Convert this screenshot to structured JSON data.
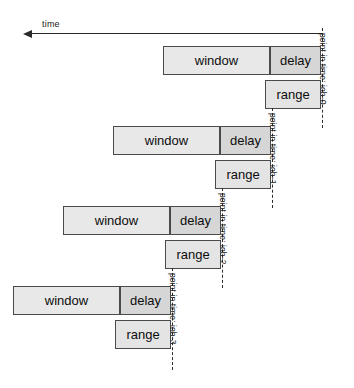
{
  "diagram": {
    "axis": {
      "label": "time",
      "direction": "leftward",
      "x_start": 322,
      "x_end": 32,
      "y": 33
    },
    "labels": {
      "window": "window",
      "delay": "delay",
      "range": "range"
    },
    "colors": {
      "window_fill": "#e8e8e8",
      "delay_fill": "#d6d6d6",
      "range_fill": "#e4e4e4",
      "stroke": "#4a4a4a",
      "axis": "#2a2a2a",
      "marker": "#2b2b2b",
      "background": "#ffffff"
    },
    "jobs": [
      {
        "id": "job-0",
        "pit_label": "point in time: job-0",
        "pit_x": 322,
        "pit_y": 28,
        "pit_height": 100,
        "label_x": 328,
        "label_y": 33,
        "window": {
          "x": 163,
          "y": 46,
          "w": 107,
          "h": 29
        },
        "delay": {
          "x": 270,
          "y": 46,
          "w": 51,
          "h": 29
        },
        "range": {
          "x": 265,
          "y": 80,
          "w": 56,
          "h": 29
        }
      },
      {
        "id": "job-1",
        "pit_label": "point in time: job-1",
        "pit_x": 272,
        "pit_y": 108,
        "pit_height": 100,
        "label_x": 278,
        "label_y": 113,
        "window": {
          "x": 113,
          "y": 126,
          "w": 107,
          "h": 29
        },
        "delay": {
          "x": 220,
          "y": 126,
          "w": 51,
          "h": 29
        },
        "range": {
          "x": 215,
          "y": 160,
          "w": 56,
          "h": 29
        }
      },
      {
        "id": "job-2",
        "pit_label": "point in time: job-2",
        "pit_x": 222,
        "pit_y": 188,
        "pit_height": 100,
        "label_x": 228,
        "label_y": 193,
        "window": {
          "x": 63,
          "y": 206,
          "w": 107,
          "h": 29
        },
        "delay": {
          "x": 170,
          "y": 206,
          "w": 51,
          "h": 29
        },
        "range": {
          "x": 165,
          "y": 240,
          "w": 56,
          "h": 29
        }
      },
      {
        "id": "job-3",
        "pit_label": "point in time: job-3",
        "pit_x": 172,
        "pit_y": 268,
        "pit_height": 102,
        "label_x": 178,
        "label_y": 273,
        "window": {
          "x": 13,
          "y": 286,
          "w": 107,
          "h": 29
        },
        "delay": {
          "x": 120,
          "y": 286,
          "w": 51,
          "h": 29
        },
        "range": {
          "x": 115,
          "y": 320,
          "w": 56,
          "h": 29
        }
      }
    ]
  }
}
